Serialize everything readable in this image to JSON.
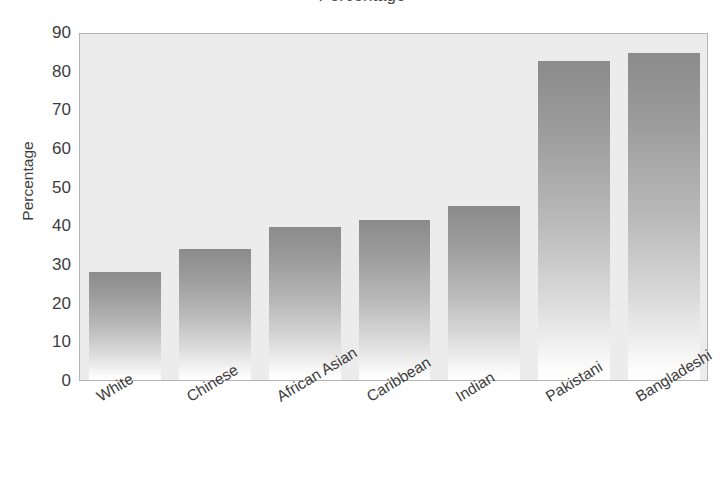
{
  "figure": {
    "title_cropped": "Percentage",
    "background_color": "#ffffff"
  },
  "chart_data": {
    "type": "bar",
    "title": "",
    "xlabel": "",
    "ylabel": "Percentage",
    "categories": [
      "White",
      "Chinese",
      "African Asian",
      "Caribbean",
      "Indian",
      "Pakistani",
      "Bangladeshi"
    ],
    "values": [
      28,
      34,
      39.5,
      41.5,
      45,
      82.5,
      84.5
    ],
    "ylim": [
      0,
      90
    ],
    "yticks": [
      0,
      10,
      20,
      30,
      40,
      50,
      60,
      70,
      80,
      90
    ],
    "ytick_labels": [
      "0",
      "10",
      "20",
      "30",
      "40",
      "50",
      "60",
      "70",
      "80",
      "90"
    ],
    "grid": false,
    "legend": null,
    "bar_style": {
      "fill": "vertical-gradient",
      "top_color": "#8b8b8b",
      "bottom_color": "#ffffff"
    },
    "plot_background": "#ececec",
    "plot_border": "#b4b4b4",
    "xtick_rotation_degrees": -31
  }
}
